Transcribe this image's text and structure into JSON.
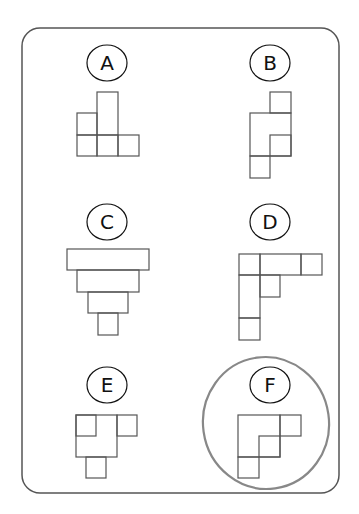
{
  "puzzle": {
    "frame": {
      "x": 22,
      "y": 28,
      "w": 317,
      "h": 465,
      "r": 18,
      "stroke": "#555555"
    },
    "options": [
      {
        "label": "A",
        "cx": 107,
        "cy": 63,
        "rects": [
          [
            97,
            92,
            21,
            43
          ],
          [
            77,
            113,
            20,
            22
          ],
          [
            77,
            135,
            20,
            21
          ],
          [
            97,
            135,
            21,
            21
          ],
          [
            118,
            135,
            21,
            21
          ]
        ]
      },
      {
        "label": "B",
        "cx": 270,
        "cy": 63,
        "rects": [
          [
            270,
            92,
            21,
            21
          ],
          [
            250,
            113,
            41,
            43
          ],
          [
            270,
            135,
            21,
            21
          ],
          [
            250,
            156,
            20,
            22
          ]
        ]
      },
      {
        "label": "C",
        "cx": 107,
        "cy": 222,
        "rects": [
          [
            67,
            249,
            82,
            21
          ],
          [
            77,
            270,
            62,
            22
          ],
          [
            88,
            292,
            40,
            21
          ],
          [
            98,
            313,
            20,
            22
          ]
        ]
      },
      {
        "label": "D",
        "cx": 270,
        "cy": 222,
        "rects": [
          [
            239,
            254,
            21,
            21
          ],
          [
            260,
            254,
            41,
            21
          ],
          [
            301,
            254,
            21,
            21
          ],
          [
            239,
            275,
            21,
            43
          ],
          [
            260,
            275,
            20,
            22
          ],
          [
            239,
            318,
            21,
            22
          ]
        ]
      },
      {
        "label": "E",
        "cx": 107,
        "cy": 385,
        "rects": [
          [
            76,
            415,
            41,
            42
          ],
          [
            76,
            415,
            20,
            21
          ],
          [
            117,
            415,
            20,
            21
          ],
          [
            86,
            457,
            20,
            21
          ]
        ]
      },
      {
        "label": "F",
        "cx": 270,
        "cy": 385,
        "circled": true,
        "rects": [
          [
            238,
            415,
            42,
            42
          ],
          [
            280,
            415,
            21,
            21
          ],
          [
            259,
            436,
            21,
            21
          ],
          [
            238,
            457,
            21,
            21
          ]
        ]
      }
    ],
    "answer_circle": {
      "cx": 266,
      "cy": 423,
      "rx": 63,
      "ry": 66,
      "stroke": "#888888"
    },
    "selected_answer": "F"
  }
}
